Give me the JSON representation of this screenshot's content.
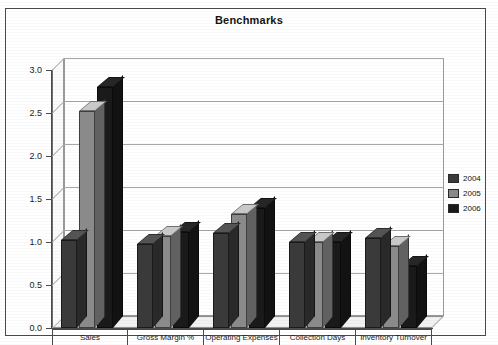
{
  "chart_data": {
    "type": "bar",
    "title": "Benchmarks",
    "xlabel": "",
    "ylabel": "",
    "ylim": [
      0.0,
      3.0
    ],
    "ytick_labels": [
      "3.0",
      "2.5",
      "2.0",
      "1.5",
      "1.0",
      "0.5",
      "0.0"
    ],
    "ytick_values": [
      3.0,
      2.5,
      2.0,
      1.5,
      1.0,
      0.5,
      0.0
    ],
    "grid": true,
    "legend_position": "right",
    "three_d": true,
    "categories": [
      "Sales",
      "Gross Margin %",
      "Operating Expenses",
      "Collection Days",
      "Inventory Turnover"
    ],
    "series": [
      {
        "name": "2004",
        "color": "#3a3a3a",
        "values": [
          1.02,
          0.98,
          1.1,
          1.0,
          1.05
        ]
      },
      {
        "name": "2005",
        "color": "#8a8a8a",
        "values": [
          2.52,
          1.07,
          1.32,
          1.0,
          0.95
        ]
      },
      {
        "name": "2006",
        "color": "#1a1a1a",
        "values": [
          2.8,
          1.12,
          1.4,
          1.0,
          0.72
        ]
      }
    ]
  },
  "legend": {
    "items": [
      {
        "label": "2004",
        "color": "#3a3a3a"
      },
      {
        "label": "2005",
        "color": "#8a8a8a"
      },
      {
        "label": "2006",
        "color": "#1a1a1a"
      }
    ]
  }
}
